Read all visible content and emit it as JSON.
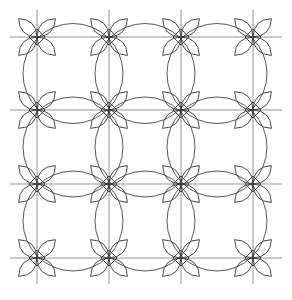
{
  "diagram": {
    "title": "",
    "type": "geometric-tiling",
    "background": "#ffffff",
    "line_color": "#444444",
    "grid_color": "#7a7a7a",
    "grid": {
      "x_lines": [
        37,
        109,
        181,
        253
      ],
      "y_lines": [
        37,
        110,
        184,
        258
      ],
      "x_extent": [
        10,
        282
      ],
      "y_extent": [
        10,
        284
      ]
    },
    "nodes_description": "4-petal star (two crossing lens pairs) centered at each grid intersection",
    "petal": {
      "length": 26,
      "width": 12
    },
    "circles": {
      "radius": 50,
      "description": "large circles centered between grid nodes forming concave squares"
    }
  }
}
